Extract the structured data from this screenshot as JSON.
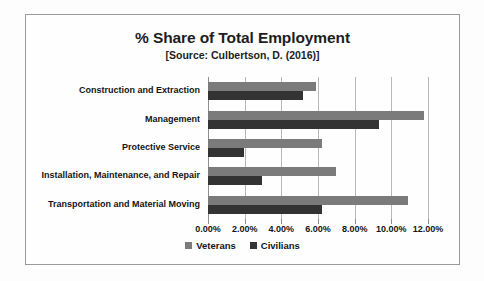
{
  "chart_data": {
    "type": "bar",
    "orientation": "horizontal",
    "title": "% Share of Total Employment",
    "subtitle": "[Source: Culbertson, D. (2016)]",
    "xlabel": "",
    "ylabel": "",
    "xlim": [
      0,
      12
    ],
    "grid": true,
    "legend_position": "bottom",
    "tick_labels": [
      "0.00%",
      "2.00%",
      "4.00%",
      "6.00%",
      "8.00%",
      "10.00%",
      "12.00%"
    ],
    "tick_values": [
      0,
      2,
      4,
      6,
      8,
      10,
      12
    ],
    "categories": [
      "Construction and Extraction",
      "Management",
      "Protective Service",
      "Installation, Maintenance, and Repair",
      "Transportation and Material Moving"
    ],
    "series": [
      {
        "name": "Veterans",
        "color": "#7b7b7b",
        "values": [
          5.9,
          11.8,
          6.2,
          7.0,
          10.9
        ]
      },
      {
        "name": "Civilians",
        "color": "#333333",
        "values": [
          5.2,
          9.35,
          1.95,
          2.95,
          6.2
        ]
      }
    ]
  },
  "legend": {
    "items": [
      {
        "label": "Veterans"
      },
      {
        "label": "Civilians"
      }
    ]
  },
  "colors": {
    "veterans": "#7b7b7b",
    "civilians": "#333333",
    "frame": "#9a9a9a",
    "gridline": "#b8b8b8",
    "text": "#141414",
    "background": "#fefefe"
  }
}
